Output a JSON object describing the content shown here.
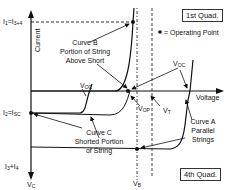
{
  "diagram": {
    "y_axis_label": "Current",
    "x_axis_label": "Voltage",
    "quadrants": {
      "first": "1st Quad.",
      "fourth": "4th Quad."
    },
    "legend": {
      "symbol": "•",
      "text": "= Operating Point"
    },
    "current_labels": {
      "top": {
        "main": "I",
        "sub1": "1",
        "eq": "=I",
        "sub2": "3+4"
      },
      "middle": {
        "main": "I",
        "sub1": "2",
        "eq": "=I",
        "sub2": "SC"
      },
      "bottom": {
        "main": "I",
        "sub1": "3",
        "eq": "+I",
        "sub2": "4"
      }
    },
    "voltage_labels": {
      "voc_left": {
        "main": "V",
        "sub": "OC"
      },
      "voc_right": {
        "main": "V",
        "sub": "OC"
      },
      "vop": {
        "main": "V",
        "sub": "OP"
      },
      "vt": {
        "main": "V",
        "sub": "T"
      },
      "vc": {
        "main": "V",
        "sub": "C"
      },
      "vb": {
        "main": "V",
        "sub": "B"
      }
    },
    "curves": {
      "b": [
        "Curve B",
        "Portion of String",
        "Above Short"
      ],
      "c": [
        "Curve C",
        "Shorted Portion",
        "of String"
      ],
      "a": [
        "Curve A",
        "Parallel",
        "Strings"
      ]
    }
  }
}
